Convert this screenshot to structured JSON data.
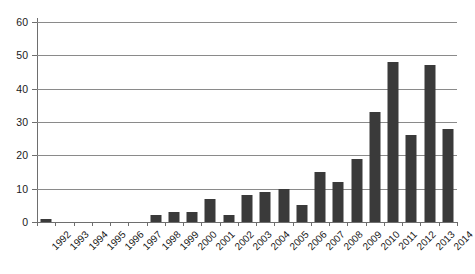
{
  "chart_data": {
    "type": "bar",
    "title": "",
    "subtitle": "",
    "xlabel": "",
    "ylabel": "",
    "ylim": [
      0,
      60
    ],
    "ytick_step": 10,
    "yticks": [
      0,
      10,
      20,
      30,
      40,
      50,
      60
    ],
    "ytick_labels": [
      "0",
      "10",
      "20",
      "30",
      "40",
      "50",
      "60"
    ],
    "grid": true,
    "grid_axis": "y",
    "legend": false,
    "legend_position": "none",
    "bar_color": "#3a3a3a",
    "axis_color": "#6e6e6e",
    "grid_color": "#8a8a8a",
    "categories": [
      "1992",
      "1993",
      "1994",
      "1995",
      "1996",
      "1997",
      "1998",
      "1999",
      "2000",
      "2001",
      "2002",
      "2003",
      "2004",
      "2005",
      "2006",
      "2007",
      "2008",
      "2009",
      "2010",
      "2011",
      "2012",
      "2013",
      "2014"
    ],
    "values": [
      1,
      0,
      0,
      0,
      0,
      0,
      2,
      3,
      3,
      7,
      2,
      8,
      9,
      10,
      5,
      15,
      12,
      19,
      33,
      48,
      26,
      47,
      28
    ],
    "annotations": []
  }
}
